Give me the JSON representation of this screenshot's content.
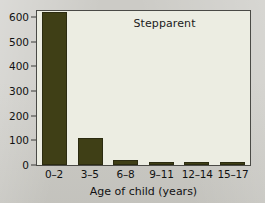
{
  "chart_data": {
    "type": "bar",
    "title": "Stepparent",
    "xlabel": "Age of child (years)",
    "ylabel": "",
    "categories": [
      "0–2",
      "3–5",
      "6–8",
      "9–11",
      "12–14",
      "15–17"
    ],
    "values": [
      620,
      110,
      20,
      8,
      8,
      8
    ],
    "ylim": [
      0,
      625
    ],
    "yticks": [
      0,
      100,
      200,
      300,
      400,
      500,
      600
    ],
    "ytick_labels": [
      "0",
      "100",
      "200",
      "300",
      "400",
      "500",
      "600"
    ],
    "grid": false,
    "legend": false,
    "bar_color": "#3f3f16",
    "plot_background": "#ecede2",
    "page_background": "#cccbc6",
    "axis_color": "#4a4a46"
  }
}
